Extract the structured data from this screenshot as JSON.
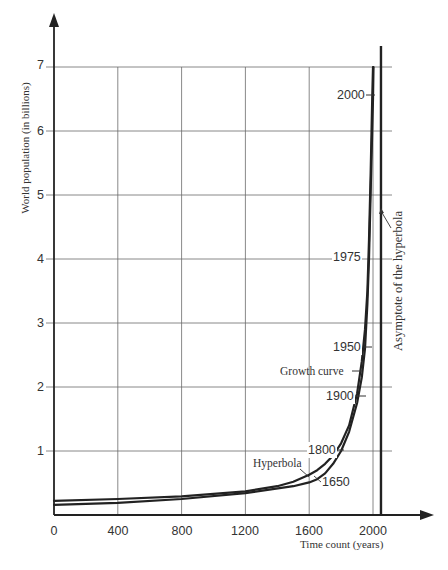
{
  "chart_data": {
    "type": "line",
    "title": "",
    "xlabel": "Time count (years)",
    "ylabel": "World population (in billions)",
    "xlim": [
      0,
      2375
    ],
    "ylim": [
      0,
      7.8
    ],
    "x_ticks": [
      0,
      400,
      800,
      1200,
      1600,
      2000
    ],
    "y_ticks": [
      1,
      2,
      3,
      4,
      5,
      6,
      7
    ],
    "grid": true,
    "legend": "none (inline annotations)",
    "series": [
      {
        "name": "Growth curve",
        "x": [
          0,
          400,
          800,
          1200,
          1500,
          1600,
          1650,
          1700,
          1750,
          1800,
          1850,
          1900,
          1930,
          1950,
          1965,
          1975,
          1985,
          1995,
          2000,
          2003
        ],
        "y": [
          0.16,
          0.19,
          0.25,
          0.34,
          0.45,
          0.51,
          0.56,
          0.65,
          0.8,
          1.0,
          1.3,
          1.75,
          2.15,
          2.6,
          3.3,
          4.0,
          5.0,
          6.0,
          6.5,
          7.0
        ]
      },
      {
        "name": "Hyperbola",
        "x": [
          0,
          400,
          800,
          1200,
          1400,
          1500,
          1600,
          1650,
          1700,
          1750,
          1800,
          1850,
          1900,
          1930,
          1950,
          1965,
          1975,
          1985,
          1995,
          2000
        ],
        "y": [
          0.22,
          0.25,
          0.29,
          0.37,
          0.45,
          0.52,
          0.63,
          0.7,
          0.8,
          0.93,
          1.12,
          1.4,
          1.9,
          2.4,
          2.9,
          3.5,
          4.3,
          5.3,
          6.5,
          7.0
        ]
      }
    ],
    "vertical_lines": [
      {
        "name": "Asymptote of the hyperbola",
        "x": 2050
      }
    ],
    "annotations": [
      {
        "text": "2000",
        "series": "Growth curve",
        "year": 2000,
        "y": 6.5
      },
      {
        "text": "1975",
        "series": "Growth curve",
        "year": 1975,
        "y": 4.0
      },
      {
        "text": "1950",
        "series": "Growth curve",
        "year": 1950,
        "y": 2.6
      },
      {
        "text": "1900",
        "series": "Growth curve",
        "year": 1900,
        "y": 1.75
      },
      {
        "text": "1800",
        "series": "Growth curve",
        "year": 1800,
        "y": 1.0
      },
      {
        "text": "1650",
        "series": "Growth curve",
        "year": 1650,
        "y": 0.56
      },
      {
        "text": "Growth curve",
        "points_to": "Growth curve"
      },
      {
        "text": "Hyperbola",
        "points_to": "Hyperbola"
      },
      {
        "text": "Asymptote of the hyperbola",
        "points_to": "vertical asymptote"
      }
    ]
  },
  "axes": {
    "y_title": "World population (in billions)",
    "x_title": "Time count (years)",
    "y_tick_labels": [
      "1",
      "2",
      "3",
      "4",
      "5",
      "6",
      "7"
    ],
    "x_tick_labels": [
      "0",
      "400",
      "800",
      "1200",
      "1600",
      "2000"
    ]
  },
  "labels": {
    "y2000": "2000",
    "y1975": "1975",
    "y1950": "1950",
    "y1900": "1900",
    "y1800": "1800",
    "y1650": "1650",
    "growth_curve": "Growth curve",
    "hyperbola": "Hyperbola",
    "asymptote": "Asymptote of the hyperbola"
  },
  "colors": {
    "curve": "#222222",
    "axis": "#222222",
    "grid": "#6a6a6a",
    "text": "#333333"
  }
}
